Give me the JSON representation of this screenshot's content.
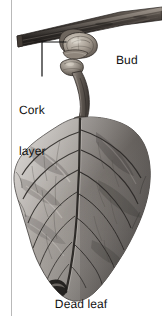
{
  "figure": {
    "type": "botanical-illustration",
    "background_color": "#ffffff",
    "width": 162,
    "height": 316,
    "column_rule": {
      "name": "column-rule",
      "color": "#b9b9b9",
      "x": 11,
      "width": 1
    }
  },
  "labels": {
    "cork_layer_line1": "Cork",
    "cork_layer_line2": "layer",
    "bud": "Bud",
    "leader_line_color": "#111111"
  },
  "caption": {
    "text": "Dead leaf"
  },
  "artwork": {
    "palette": {
      "branch_dark": "#2b2724",
      "branch_mid": "#57504a",
      "branch_light": "#9b938b",
      "bud_light": "#c9c2b8",
      "bud_shadow": "#6a625a",
      "petiole": "#6f6862",
      "leaf_dark": "#4a4643",
      "leaf_mid": "#7e7a76",
      "leaf_light": "#b4b0ac",
      "leaf_pale": "#d2cfcb",
      "vein": "#3b3835",
      "outline": "#2e2b29"
    },
    "elements": [
      "woody branch rising left-to-right across the top",
      "axillary bud with overlapping scales at the node",
      "cork (abscission) layer at the base of the leaf stalk",
      "curved petiole descending from the node",
      "large withered leaf with midrib and pinnate veins",
      "curled dark necrotic leaf tip at the bottom"
    ]
  }
}
